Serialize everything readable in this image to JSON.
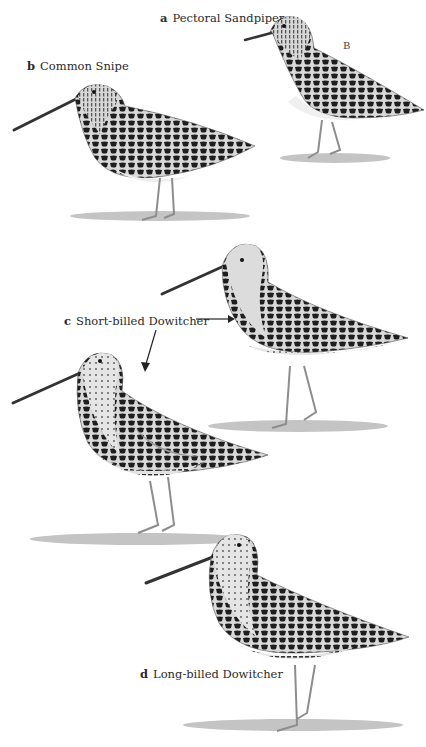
{
  "plate": {
    "birds": [
      {
        "letter": "a",
        "name": "Pectoral Sandpiper",
        "age": "B"
      },
      {
        "letter": "b",
        "name": "Common Snipe",
        "age": ""
      },
      {
        "letter": "c",
        "name": "Short-billed Dowitcher",
        "ages": [
          "J",
          "B"
        ]
      },
      {
        "letter": "d",
        "name": "Long-billed Dowitcher",
        "age": "B"
      }
    ]
  },
  "colors": {
    "background": "#ffffff",
    "plumage_dark": "#1e1e1e",
    "plumage_mid": "#8a8a8a",
    "plumage_light": "#e6e6e6",
    "shadow": "#bdbdbd"
  }
}
